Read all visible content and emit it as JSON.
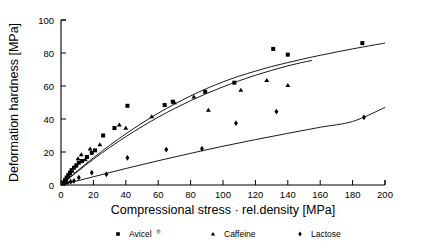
{
  "chart_data": {
    "type": "scatter",
    "title": "",
    "xlabel": "Compressional stress · rel.density [MPa]",
    "ylabel": "Deformation hardness [MPa]",
    "xlim": [
      0,
      200
    ],
    "ylim": [
      0,
      100
    ],
    "xticks": [
      0,
      20,
      40,
      60,
      80,
      100,
      120,
      140,
      160,
      180,
      200
    ],
    "yticks": [
      0,
      20,
      40,
      60,
      80,
      100
    ],
    "xtick_labels": [
      "0",
      "20",
      "40",
      "60",
      "80",
      "100",
      "120",
      "140",
      "160",
      "180",
      "200"
    ],
    "ytick_labels": [
      "0",
      "20",
      "40",
      "60",
      "80",
      "100"
    ],
    "grid": false,
    "legend_position": "bottom",
    "series": [
      {
        "name": "Avicel",
        "superscript": "®",
        "marker": "square",
        "legend_marker": "■",
        "color": "#000000",
        "points": [
          [
            1.5,
            1.5
          ],
          [
            2.5,
            3.0
          ],
          [
            3.5,
            4.5
          ],
          [
            4.5,
            6.0
          ],
          [
            5.5,
            7.5
          ],
          [
            6.5,
            9.0
          ],
          [
            8.0,
            10.5
          ],
          [
            9.5,
            12.0
          ],
          [
            11.0,
            13.5
          ],
          [
            13.0,
            14.5
          ],
          [
            16.0,
            17.0
          ],
          [
            19.0,
            19.5
          ],
          [
            21.0,
            21.0
          ],
          [
            26.0,
            30.0
          ],
          [
            33.0,
            34.5
          ],
          [
            41.0,
            48.0
          ],
          [
            64.0,
            48.5
          ],
          [
            69.0,
            50.5
          ],
          [
            89.0,
            56.5
          ],
          [
            107.0,
            62.0
          ],
          [
            131.0,
            82.5
          ],
          [
            140.0,
            79.0
          ],
          [
            186.0,
            86.0
          ]
        ],
        "fit_curve": [
          [
            0,
            0
          ],
          [
            10,
            8.5
          ],
          [
            20,
            16.5
          ],
          [
            30,
            24.0
          ],
          [
            40,
            31.0
          ],
          [
            50,
            37.5
          ],
          [
            60,
            43.5
          ],
          [
            70,
            49.0
          ],
          [
            80,
            54.0
          ],
          [
            90,
            58.5
          ],
          [
            100,
            62.5
          ],
          [
            110,
            66.0
          ],
          [
            120,
            69.0
          ],
          [
            130,
            71.8
          ],
          [
            140,
            74.2
          ],
          [
            150,
            76.5
          ],
          [
            160,
            78.6
          ],
          [
            170,
            80.6
          ],
          [
            180,
            82.5
          ],
          [
            190,
            84.3
          ],
          [
            200,
            86.0
          ]
        ]
      },
      {
        "name": "Caffeine",
        "superscript": "",
        "marker": "triangle",
        "legend_marker": "▲",
        "color": "#000000",
        "points": [
          [
            2.0,
            2.0
          ],
          [
            3.0,
            4.0
          ],
          [
            4.0,
            5.5
          ],
          [
            5.5,
            7.0
          ],
          [
            7.0,
            8.5
          ],
          [
            9.0,
            11.5
          ],
          [
            10.5,
            16.0
          ],
          [
            12.5,
            18.5
          ],
          [
            15.0,
            15.5
          ],
          [
            18.0,
            22.0
          ],
          [
            24.0,
            24.5
          ],
          [
            36.0,
            36.5
          ],
          [
            40.0,
            34.5
          ],
          [
            56.0,
            41.5
          ],
          [
            70.0,
            50.0
          ],
          [
            82.0,
            53.5
          ],
          [
            91.0,
            45.5
          ],
          [
            111.0,
            57.5
          ],
          [
            127.0,
            63.5
          ],
          [
            140.0,
            60.5
          ]
        ],
        "fit_curve": [
          [
            0,
            0
          ],
          [
            10,
            8.0
          ],
          [
            20,
            15.6
          ],
          [
            30,
            22.7
          ],
          [
            40,
            29.3
          ],
          [
            50,
            35.4
          ],
          [
            60,
            41.1
          ],
          [
            70,
            46.3
          ],
          [
            80,
            51.1
          ],
          [
            90,
            55.5
          ],
          [
            100,
            59.5
          ],
          [
            110,
            63.2
          ],
          [
            120,
            66.5
          ],
          [
            130,
            69.5
          ],
          [
            140,
            72.2
          ],
          [
            150,
            74.5
          ],
          [
            155,
            75.5
          ]
        ]
      },
      {
        "name": "Lactose",
        "superscript": "",
        "marker": "diamond",
        "legend_marker": "♦",
        "color": "#000000",
        "points": [
          [
            2.0,
            1.0
          ],
          [
            4.0,
            1.5
          ],
          [
            6.0,
            2.0
          ],
          [
            8.0,
            2.5
          ],
          [
            11.0,
            4.5
          ],
          [
            19.0,
            7.5
          ],
          [
            28.0,
            6.5
          ],
          [
            41.0,
            16.5
          ],
          [
            65.0,
            21.5
          ],
          [
            87.0,
            22.0
          ],
          [
            108.0,
            37.5
          ],
          [
            133.0,
            44.5
          ],
          [
            187.0,
            41.0
          ]
        ],
        "fit_curve": [
          [
            0,
            0
          ],
          [
            20,
            5.0
          ],
          [
            40,
            10.0
          ],
          [
            60,
            14.7
          ],
          [
            80,
            19.2
          ],
          [
            100,
            23.5
          ],
          [
            120,
            27.5
          ],
          [
            140,
            31.3
          ],
          [
            160,
            35.0
          ],
          [
            180,
            38.5
          ],
          [
            200,
            47.0
          ]
        ]
      }
    ]
  },
  "legend": {
    "entries": [
      {
        "marker": "■",
        "label": "Avicel",
        "sup": "®"
      },
      {
        "marker": "▲",
        "label": "Caffeine",
        "sup": ""
      },
      {
        "marker": "♦",
        "label": "Lactose",
        "sup": ""
      }
    ]
  },
  "axes": {
    "x_title": "Compressional stress · rel.density [MPa]",
    "y_title": "Deformation hardness [MPa]"
  }
}
